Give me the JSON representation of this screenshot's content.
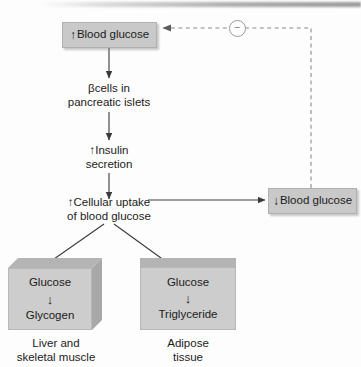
{
  "diagram": {
    "colors": {
      "box_fill": "#c9c9c9",
      "cube_front": "#cdcdcd",
      "cube_top": "#b4b4b4",
      "cube_side": "#a8a8a8",
      "line": "#3a3a3a",
      "dashed_line": "#8a8a8a",
      "text": "#1b1b1b"
    },
    "nodes": {
      "blood_glucose_high": {
        "arrow_symbol": "↑",
        "label": "Blood glucose"
      },
      "beta_cells": {
        "line1": "βcells in",
        "line2": "pancreatic islets"
      },
      "insulin_secretion": {
        "arrow_symbol": "↑",
        "line1": "Insulin",
        "line2": "secretion"
      },
      "cellular_uptake": {
        "arrow_symbol": "↑",
        "line1": "Cellular uptake",
        "line2": "of blood glucose"
      },
      "blood_glucose_low": {
        "arrow_symbol": "↓",
        "label": "Blood glucose"
      },
      "liver_muscle": {
        "substrate": "Glucose",
        "arrow_symbol": "↓",
        "product": "Glycogen",
        "caption_line1": "Liver and",
        "caption_line2": "skeletal muscle"
      },
      "adipose": {
        "substrate": "Glucose",
        "arrow_symbol": "↓",
        "product": "Triglyceride",
        "caption_line1": "Adipose",
        "caption_line2": "tissue"
      }
    },
    "feedback": {
      "symbol": "−",
      "type": "negative"
    }
  }
}
